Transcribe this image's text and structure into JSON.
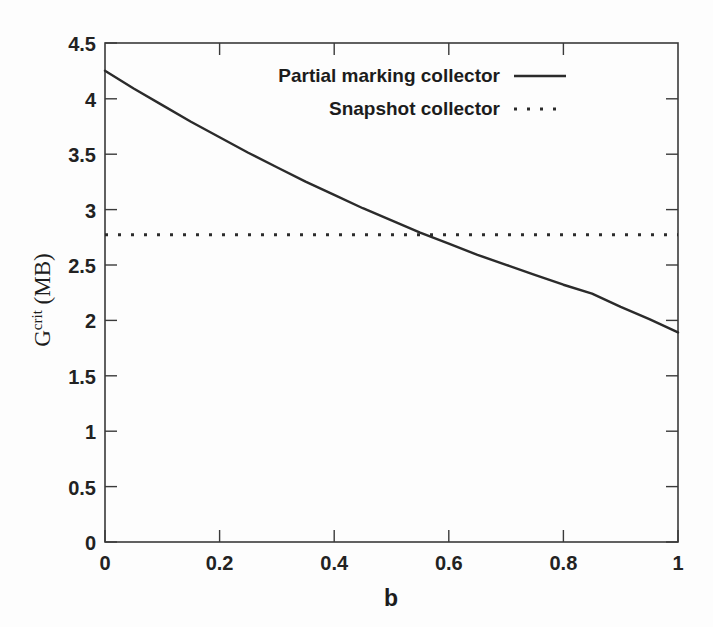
{
  "chart_data": {
    "type": "line",
    "title": "",
    "subtitle": "",
    "xlabel": "b",
    "ylabel": "G^crit (MB)",
    "ylabel_base": "G",
    "ylabel_sup": "crit",
    "ylabel_unit": "(MB)",
    "xlim": [
      0,
      1
    ],
    "ylim": [
      0,
      4.5
    ],
    "grid": false,
    "legend_position": "top-right",
    "xticks": [
      0,
      0.2,
      0.4,
      0.6,
      0.8,
      1
    ],
    "xtick_labels": [
      "0",
      "0.2",
      "0.4",
      "0.6",
      "0.8",
      "1"
    ],
    "xticks_minor": [
      0.1,
      0.3,
      0.5,
      0.7,
      0.9
    ],
    "yticks": [
      0,
      0.5,
      1,
      1.5,
      2,
      2.5,
      3,
      3.5,
      4,
      4.5
    ],
    "ytick_labels": [
      "0",
      "0.5",
      "1",
      "1.5",
      "2",
      "2.5",
      "3",
      "3.5",
      "4",
      "4.5"
    ],
    "x": [
      0,
      0.05,
      0.1,
      0.15,
      0.2,
      0.25,
      0.3,
      0.35,
      0.4,
      0.45,
      0.5,
      0.55,
      0.6,
      0.65,
      0.7,
      0.75,
      0.8,
      0.85,
      0.9,
      0.95,
      1
    ],
    "series": [
      {
        "name": "Partial marking collector",
        "style": "solid",
        "color": "#2b2b2b",
        "values": [
          4.25,
          4.09,
          3.94,
          3.79,
          3.65,
          3.51,
          3.38,
          3.25,
          3.13,
          3.01,
          2.9,
          2.79,
          2.69,
          2.59,
          2.5,
          2.41,
          2.32,
          2.24,
          2.12,
          2.01,
          1.89
        ]
      },
      {
        "name": "Snapshot collector",
        "style": "dotted",
        "color": "#2b2b2b",
        "constant": 2.77,
        "values": [
          2.77,
          2.77,
          2.77,
          2.77,
          2.77,
          2.77,
          2.77,
          2.77,
          2.77,
          2.77,
          2.77,
          2.77,
          2.77,
          2.77,
          2.77,
          2.77,
          2.77,
          2.77,
          2.77,
          2.77,
          2.77
        ]
      }
    ],
    "annotations": {
      "crossover_b": 0.43,
      "crossover_value": 2.77
    }
  },
  "legend": {
    "entries": [
      {
        "label": "Partial marking collector",
        "style": "solid"
      },
      {
        "label": "Snapshot collector",
        "style": "dotted"
      }
    ]
  }
}
